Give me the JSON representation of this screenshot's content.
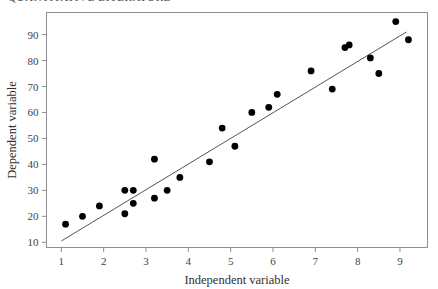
{
  "header": {
    "clipped_text": "QUANTITATIVE LITERATURE"
  },
  "chart_data": {
    "type": "scatter",
    "title": "",
    "xlabel": "Independent variable",
    "ylabel": "Dependent variable",
    "xlim": [
      0.65,
      9.65
    ],
    "ylim": [
      8.0,
      98.5
    ],
    "xticks": [
      1,
      2,
      3,
      4,
      5,
      6,
      7,
      8,
      9
    ],
    "xtick_labels": [
      "1",
      "2",
      "3",
      "4",
      "5",
      "6",
      "7",
      "8",
      "9"
    ],
    "yticks": [
      10,
      20,
      30,
      40,
      50,
      60,
      70,
      80,
      90
    ],
    "ytick_labels": [
      "10",
      "20",
      "30",
      "40",
      "50",
      "60",
      "70",
      "80",
      "90"
    ],
    "grid": false,
    "legend": null,
    "marker_color": "#000000",
    "marker_radius": 3.4,
    "frame_color": "#8e8e8e",
    "series": [
      {
        "name": "observations",
        "x": [
          1.1,
          1.5,
          1.9,
          2.5,
          2.5,
          2.7,
          2.7,
          3.2,
          3.2,
          3.5,
          3.8,
          4.5,
          4.8,
          5.1,
          5.5,
          5.9,
          6.1,
          6.9,
          7.4,
          7.7,
          7.8,
          8.3,
          8.5,
          8.9,
          9.2
        ],
        "y": [
          17,
          20,
          24,
          30,
          21,
          30,
          25,
          42,
          27,
          30,
          35,
          41,
          54,
          47,
          60,
          62,
          67,
          76,
          69,
          85,
          86,
          81,
          75,
          95,
          88
        ]
      }
    ],
    "fit_line": {
      "name": "regression line",
      "color": "#555555",
      "x_start": 1.0,
      "y_start": 10.5,
      "x_end": 9.15,
      "y_end": 91.0
    }
  }
}
